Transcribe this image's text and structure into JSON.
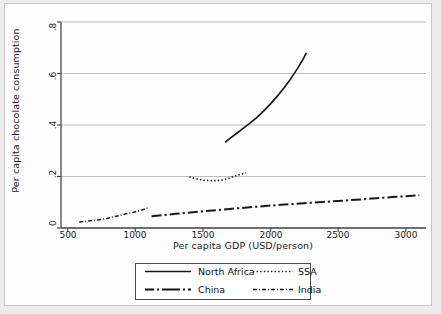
{
  "figure": {
    "background_color": "#ffffff",
    "page_color": "#ececec",
    "frame_color": "#c8c8c8",
    "axis_color": "#4a4a4a",
    "grid_color": "#b4b4b4",
    "series_color": "#1a1a1a"
  },
  "chart_data": {
    "type": "line",
    "title": "",
    "subtitle": "",
    "xlabel": "Per capita GDP (USD/person)",
    "ylabel": "Per capita chocolate consumption",
    "xlim": [
      450,
      3150
    ],
    "ylim": [
      0,
      0.8
    ],
    "xticks": [
      500,
      1000,
      1500,
      2000,
      2500,
      3000
    ],
    "xtick_labels": [
      "500",
      "1000",
      "1500",
      "2000",
      "2500",
      "3000"
    ],
    "yticks": [
      0,
      0.2,
      0.4,
      0.6,
      0.8
    ],
    "ytick_labels": [
      "0",
      ".2",
      ".4",
      ".6",
      ".8"
    ],
    "grid": "horizontal",
    "legend_position": "below-center",
    "series": [
      {
        "name": "North Africa",
        "style": "solid",
        "x": [
          1665,
          1700,
          1750,
          1800,
          1850,
          1900,
          1950,
          2000,
          2050,
          2100,
          2150,
          2200,
          2240,
          2265
        ],
        "y": [
          0.333,
          0.348,
          0.368,
          0.388,
          0.408,
          0.43,
          0.455,
          0.482,
          0.512,
          0.545,
          0.58,
          0.62,
          0.655,
          0.68
        ]
      },
      {
        "name": "SSA",
        "style": "dotted",
        "x": [
          1400,
          1440,
          1480,
          1520,
          1560,
          1600,
          1640,
          1680,
          1720,
          1760,
          1800,
          1820
        ],
        "y": [
          0.199,
          0.192,
          0.188,
          0.185,
          0.184,
          0.184,
          0.186,
          0.191,
          0.199,
          0.206,
          0.212,
          0.214
        ]
      },
      {
        "name": "China",
        "style": "dash-dot-bold",
        "x": [
          1120,
          1300,
          1500,
          1700,
          1900,
          2100,
          2300,
          2500,
          2700,
          2900,
          3100
        ],
        "y": [
          0.046,
          0.055,
          0.065,
          0.074,
          0.083,
          0.091,
          0.098,
          0.105,
          0.112,
          0.12,
          0.127
        ]
      },
      {
        "name": "India",
        "style": "dash-dot-fine",
        "x": [
          585,
          650,
          720,
          790,
          860,
          930,
          1000,
          1060,
          1090
        ],
        "y": [
          0.023,
          0.027,
          0.031,
          0.037,
          0.046,
          0.055,
          0.063,
          0.072,
          0.078
        ]
      }
    ]
  },
  "legend": {
    "entries": [
      {
        "label": "North Africa",
        "style": "solid"
      },
      {
        "label": "SSA",
        "style": "dotted"
      },
      {
        "label": "China",
        "style": "dash-dot-bold"
      },
      {
        "label": "India",
        "style": "dash-dot-fine"
      }
    ]
  }
}
